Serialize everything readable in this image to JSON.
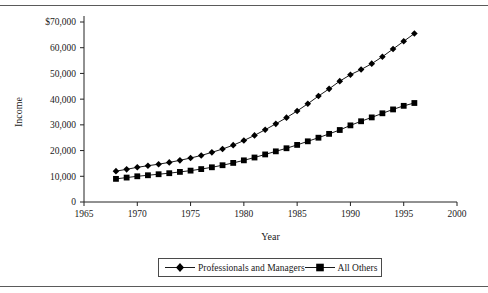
{
  "figure": {
    "y_axis_title": "Income",
    "x_axis_title": "Year"
  },
  "legend": {
    "items": [
      {
        "label": "Professionals and Managers",
        "marker": "diamond-marker-icon"
      },
      {
        "label": "All Others",
        "marker": "square-marker-icon"
      }
    ]
  },
  "chart_data": {
    "type": "line",
    "title": "",
    "subtitle": "",
    "xlabel": "Year",
    "ylabel": "Income",
    "xlim": [
      1965,
      2000
    ],
    "ylim": [
      0,
      70000
    ],
    "grid": false,
    "legend_position": "bottom",
    "x_ticks": [
      1965,
      1970,
      1975,
      1980,
      1985,
      1990,
      1995,
      2000
    ],
    "x_tick_labels": [
      "1965",
      "1970",
      "1975",
      "1980",
      "1985",
      "1990",
      "1995",
      "2000"
    ],
    "y_ticks": [
      0,
      10000,
      20000,
      30000,
      40000,
      50000,
      60000,
      70000
    ],
    "y_tick_labels": [
      "0",
      "10,000",
      "20,000",
      "30,000",
      "40,000",
      "50,000",
      "60,000",
      "$70,000"
    ],
    "x": [
      1968,
      1969,
      1970,
      1971,
      1972,
      1973,
      1974,
      1975,
      1976,
      1977,
      1978,
      1979,
      1980,
      1981,
      1982,
      1983,
      1984,
      1985,
      1986,
      1987,
      1988,
      1989,
      1990,
      1991,
      1992,
      1993,
      1994,
      1995,
      1996
    ],
    "series": [
      {
        "name": "Professionals and Managers",
        "marker": "diamond",
        "color": "#000000",
        "values": [
          12000,
          12700,
          13500,
          14100,
          14700,
          15400,
          16200,
          17100,
          18100,
          19300,
          20600,
          22100,
          23900,
          25900,
          28100,
          30400,
          32800,
          35400,
          38200,
          41200,
          44000,
          47000,
          49500,
          51500,
          53800,
          56500,
          59500,
          62500,
          65500
        ]
      },
      {
        "name": "All Others",
        "marker": "square",
        "color": "#000000",
        "values": [
          9000,
          9500,
          10000,
          10400,
          10800,
          11200,
          11700,
          12200,
          12800,
          13500,
          14300,
          15200,
          16200,
          17300,
          18500,
          19700,
          20900,
          22200,
          23600,
          25000,
          26500,
          28000,
          29800,
          31400,
          32900,
          34500,
          36000,
          37400,
          38500
        ]
      }
    ]
  }
}
